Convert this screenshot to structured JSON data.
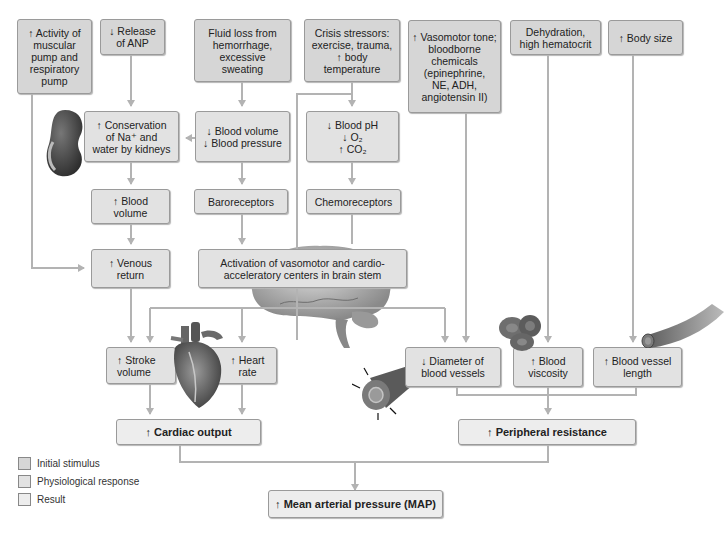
{
  "colors": {
    "initial_stimulus": "#d6d6d6",
    "physiological_response": "#e2e2e2",
    "result": "#ededed",
    "arrows": "#b3b3b3"
  },
  "stimuli": {
    "muscular_pump": "↑ Activity of\nmuscular\npump and\nrespiratory\npump",
    "anp": "↓ Release\nof ANP",
    "fluid_loss": "Fluid loss from\nhemorrhage,\nexcessive\nsweating",
    "crisis": "Crisis stressors:\nexercise, trauma,\n↑ body\ntemperature",
    "vasomotor": "↑ Vasomotor tone;\nbloodborne\nchemicals\n(epinephrine,\nNE, ADH,\nangiotensin II)",
    "dehydration": "Dehydration,\nhigh hematocrit",
    "body_size": "↑ Body size"
  },
  "responses": {
    "conservation": "↑ Conservation\nof Na⁺ and\nwater by kidneys",
    "blood_volume_pressure": "↓ Blood volume\n↓ Blood pressure",
    "blood_ph": "↓ Blood pH\n↓ O₂\n↑ CO₂",
    "blood_volume": "↑ Blood\nvolume",
    "baroreceptors": "Baroreceptors",
    "chemoreceptors": "Chemoreceptors",
    "venous_return": "↑ Venous\nreturn",
    "activation": "Activation of vasomotor and cardio-\nacceleratory centers in brain stem",
    "stroke_volume": "↑ Stroke\nvolume",
    "heart_rate": "↑ Heart\nrate",
    "diameter": "↓ Diameter of\nblood vessels",
    "viscosity": "↑ Blood\nviscosity",
    "vessel_length": "↑ Blood vessel\nlength"
  },
  "results": {
    "cardiac_output": "↑ Cardiac output",
    "peripheral_resistance": "↑ Peripheral resistance",
    "map": "↑ Mean arterial pressure (MAP)"
  },
  "legend": [
    {
      "label": "Initial stimulus"
    },
    {
      "label": "Physiological response"
    },
    {
      "label": "Result"
    }
  ]
}
